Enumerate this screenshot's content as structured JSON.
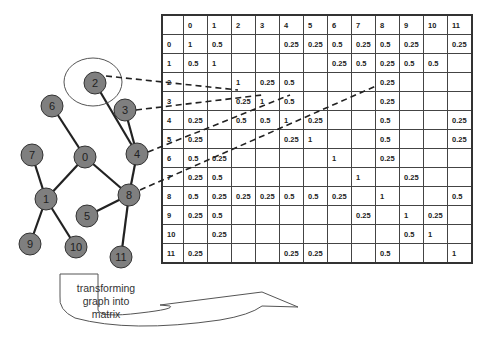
{
  "caption": {
    "line1": "transforming",
    "line2": "graph into",
    "line3": "matrix"
  },
  "graph": {
    "nodes": [
      {
        "id": "0",
        "x": 85,
        "y": 157
      },
      {
        "id": "1",
        "x": 46,
        "y": 199
      },
      {
        "id": "2",
        "x": 95,
        "y": 83
      },
      {
        "id": "3",
        "x": 125,
        "y": 110
      },
      {
        "id": "4",
        "x": 137,
        "y": 154
      },
      {
        "id": "5",
        "x": 87,
        "y": 216
      },
      {
        "id": "6",
        "x": 52,
        "y": 106
      },
      {
        "id": "7",
        "x": 32,
        "y": 155
      },
      {
        "id": "8",
        "x": 129,
        "y": 195
      },
      {
        "id": "9",
        "x": 30,
        "y": 244
      },
      {
        "id": "10",
        "x": 76,
        "y": 247
      },
      {
        "id": "11",
        "x": 121,
        "y": 257
      }
    ],
    "edges": [
      [
        "6",
        "0"
      ],
      [
        "0",
        "1"
      ],
      [
        "0",
        "8"
      ],
      [
        "7",
        "1"
      ],
      [
        "1",
        "9"
      ],
      [
        "1",
        "10"
      ],
      [
        "2",
        "4"
      ],
      [
        "3",
        "4"
      ],
      [
        "4",
        "8"
      ],
      [
        "8",
        "5"
      ],
      [
        "8",
        "11"
      ]
    ],
    "highlighted_node": "2"
  },
  "matrix": {
    "headers": [
      "",
      "0",
      "1",
      "2",
      "3",
      "4",
      "5",
      "6",
      "7",
      "8",
      "9",
      "10",
      "11"
    ],
    "rows": [
      [
        "0",
        "1",
        "0.5",
        "",
        "",
        "0.25",
        "0.25",
        "0.5",
        "0.25",
        "0.5",
        "0.25",
        "",
        "0.25"
      ],
      [
        "1",
        "0.5",
        "1",
        "",
        "",
        "",
        "",
        "0.25",
        "0.5",
        "0.25",
        "0.5",
        "0.5",
        ""
      ],
      [
        "2",
        "",
        "",
        "1",
        "0.25",
        "0.5",
        "",
        "",
        "",
        "0.25",
        "",
        "",
        ""
      ],
      [
        "3",
        "",
        "",
        "0.25",
        "1",
        "0.5",
        "",
        "",
        "",
        "0.25",
        "",
        "",
        ""
      ],
      [
        "4",
        "0.25",
        "",
        "0.5",
        "0.5",
        "1",
        "0.25",
        "",
        "",
        "0.5",
        "",
        "",
        "0.25"
      ],
      [
        "5",
        "0.25",
        "",
        "",
        "",
        "0.25",
        "1",
        "",
        "",
        "0.5",
        "",
        "",
        "0.25"
      ],
      [
        "6",
        "0.5",
        "0.25",
        "",
        "",
        "",
        "",
        "1",
        "",
        "0.25",
        "",
        "",
        ""
      ],
      [
        "7",
        "0.25",
        "0.5",
        "",
        "",
        "",
        "",
        "",
        "1",
        "",
        "0.25",
        "",
        ""
      ],
      [
        "8",
        "0.5",
        "0.25",
        "0.25",
        "0.25",
        "0.5",
        "0.5",
        "0.25",
        "",
        "1",
        "",
        "",
        "0.5"
      ],
      [
        "9",
        "0.25",
        "0.5",
        "",
        "",
        "",
        "",
        "",
        "0.25",
        "",
        "1",
        "0.25",
        ""
      ],
      [
        "10",
        "",
        "0.25",
        "",
        "",
        "",
        "",
        "",
        "",
        "",
        "0.5",
        "1",
        ""
      ],
      [
        "11",
        "0.25",
        "",
        "",
        "",
        "0.25",
        "0.25",
        "",
        "",
        "0.5",
        "",
        "",
        "1"
      ]
    ]
  },
  "colors": {
    "node_fill": "#7f7f7f",
    "node_stroke": "#333333",
    "edge": "#222222"
  }
}
